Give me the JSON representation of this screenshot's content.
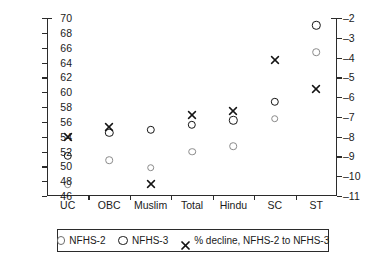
{
  "chart_data": {
    "type": "scatter",
    "title": "",
    "subtitle": "",
    "xlabel": "",
    "ylabel": "",
    "categories": [
      "UC",
      "OBC",
      "Muslim",
      "Total",
      "Hindu",
      "SC",
      "ST"
    ],
    "axes": {
      "left": {
        "label": "",
        "ylim": [
          46,
          70
        ],
        "ticks": [
          46,
          48,
          50,
          52,
          54,
          56,
          58,
          60,
          62,
          64,
          66,
          68,
          70
        ],
        "tick_labels": [
          "46",
          "48",
          "50",
          "52",
          "54",
          "56",
          "58",
          "60",
          "62",
          "64",
          "66",
          "68",
          "70"
        ]
      },
      "right": {
        "label": "",
        "ylim": [
          -11,
          -2
        ],
        "ticks": [
          -11,
          -10,
          -9,
          -8,
          -7,
          -6,
          -5,
          -4,
          -3,
          -2
        ],
        "tick_labels": [
          "–11",
          "–10",
          "–9",
          "–8",
          "–7",
          "–6",
          "–5",
          "–4",
          "–3",
          "–2"
        ]
      },
      "grid": false
    },
    "series": [
      {
        "name": "NFHS-2",
        "marker": "open-circle-light",
        "axis": "left",
        "values": [
          47.6,
          50.8,
          49.8,
          52.0,
          52.7,
          56.4,
          65.4
        ]
      },
      {
        "name": "NFHS-3",
        "marker": "open-circle-bold",
        "axis": "left",
        "values": [
          51.4,
          54.5,
          54.9,
          55.6,
          56.2,
          58.7,
          69.0
        ]
      },
      {
        "name": "% decline, NFHS-2 to NFHS-3",
        "marker": "x-cross",
        "axis": "right",
        "values": [
          -8.0,
          -7.5,
          -10.4,
          -6.9,
          -6.7,
          -4.1,
          -5.6
        ]
      }
    ],
    "legend": {
      "position": "bottom",
      "entries": [
        {
          "label": "NFHS-2",
          "marker": "open-circle-light"
        },
        {
          "label": "NFHS-3",
          "marker": "open-circle-bold"
        },
        {
          "label": "% decline, NFHS-2 to NFHS-3",
          "marker": "x-cross"
        }
      ]
    }
  }
}
